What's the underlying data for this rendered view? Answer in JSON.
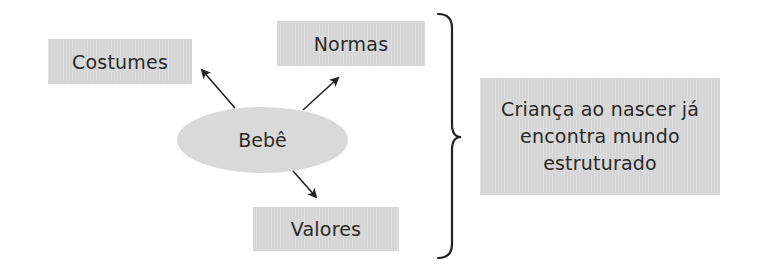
{
  "diagram": {
    "center_node": {
      "label": "Bebê",
      "shape": "ellipse"
    },
    "outer_nodes": [
      {
        "id": "costumes",
        "label": "Costumes"
      },
      {
        "id": "normas",
        "label": "Normas"
      },
      {
        "id": "valores",
        "label": "Valores"
      }
    ],
    "edges": [
      {
        "from": "Bebê",
        "to": "Costumes"
      },
      {
        "from": "Bebê",
        "to": "Normas"
      },
      {
        "from": "Bebê",
        "to": "Valores"
      }
    ],
    "grouping": {
      "type": "right-curly-brace"
    },
    "conclusion": {
      "label": "Criança ao nascer já encontra mundo estruturado"
    }
  },
  "colors": {
    "box_fill": "#d9d9d9",
    "text": "#2a2a2a",
    "lines": "#222222"
  }
}
